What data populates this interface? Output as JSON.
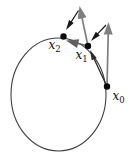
{
  "figure": {
    "canvas": {
      "width": 133,
      "height": 157,
      "background": "#ffffff"
    },
    "circle": {
      "cx": 58.5,
      "cy": 94.5,
      "rx": 47.5,
      "ry": 56.5,
      "stroke": "#3f3f3f",
      "stroke_width": 1.1
    },
    "points": [
      {
        "id": "x0",
        "x": 107,
        "y": 86.5,
        "radius": 3.2,
        "color": "#0c0c0c",
        "label": "x",
        "sub": "0",
        "label_x": 112.5,
        "label_y": 100
      },
      {
        "id": "x1",
        "x": 88,
        "y": 46,
        "radius": 3.2,
        "color": "#0c0c0c",
        "label": "x",
        "sub": "1",
        "label_x": 75.5,
        "label_y": 59
      },
      {
        "id": "x2",
        "x": 63.5,
        "y": 36.5,
        "radius": 3.2,
        "color": "#0c0c0c",
        "label": "x",
        "sub": "2",
        "label_x": 48.5,
        "label_y": 49
      }
    ],
    "arrows": [
      {
        "name": "tangent-at-x0",
        "x1": 107,
        "y1": 86.5,
        "x2": 108.5,
        "y2": 22,
        "color": "#7f7f7f",
        "stroke_width": 1.7,
        "head": "large"
      },
      {
        "name": "retraction-to-x1",
        "x1": 106,
        "y1": 25,
        "x2": 91,
        "y2": 41,
        "color": "#161616",
        "stroke_width": 1.2,
        "head": "small"
      },
      {
        "name": "step-x0-to-x1",
        "x1": 107,
        "y1": 86.5,
        "x2": 90,
        "y2": 50,
        "color": "#2b2b2b",
        "stroke_width": 1.3,
        "head": "small"
      },
      {
        "name": "tangent-at-x1",
        "x1": 88,
        "y1": 46,
        "x2": 79.5,
        "y2": 6,
        "color": "#7f7f7f",
        "stroke_width": 1.7,
        "head": "large"
      },
      {
        "name": "retraction-to-x2",
        "x1": 78.5,
        "y1": 10.5,
        "x2": 66,
        "y2": 30,
        "color": "#161616",
        "stroke_width": 1.2,
        "head": "small"
      },
      {
        "name": "step-x1-to-x2",
        "x1": 88,
        "y1": 46,
        "x2": 66,
        "y2": 40.5,
        "color": "#606060",
        "stroke_width": 1.6,
        "head": "large"
      }
    ],
    "label_style": {
      "font_size": 12,
      "sub_font_size": 8.5,
      "sub_dy": 3,
      "color": "#111111"
    },
    "head_sizes": {
      "large": {
        "length": 12.5,
        "width": 9
      },
      "small": {
        "length": 10,
        "width": 5.5
      }
    }
  }
}
